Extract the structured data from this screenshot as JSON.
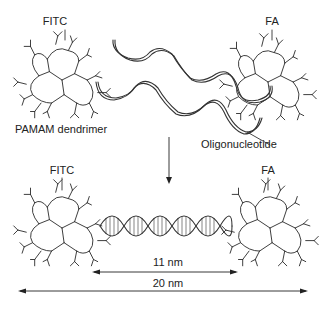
{
  "diagram": {
    "top": {
      "left_dendrimer_label": "FITC",
      "right_dendrimer_label": "FA",
      "dendrimer_caption": "PAMAM dendrimer",
      "oligo_caption": "Oligonucleotide"
    },
    "bottom": {
      "left_dendrimer_label": "FITC",
      "right_dendrimer_label": "FA",
      "inner_length_label": "11 nm",
      "outer_length_label": "20 nm"
    },
    "colors": {
      "line": "#333333",
      "background": "#ffffff"
    }
  }
}
